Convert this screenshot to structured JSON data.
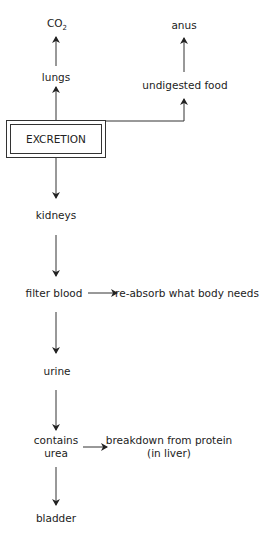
{
  "diagram": {
    "central_node": "EXCRETION",
    "nodes": {
      "co2": "CO",
      "co2_sub": "2",
      "lungs": "lungs",
      "anus": "anus",
      "undigested_food": "undigested food",
      "kidneys": "kidneys",
      "filter_blood": "filter blood",
      "reabsorb": "re-absorb what body needs",
      "urine": "urine",
      "contains_line1": "contains",
      "contains_line2": "urea",
      "breakdown_line1": "breakdown from protein",
      "breakdown_line2": "(in liver)",
      "bladder": "bladder"
    },
    "edges": [
      {
        "from": "EXCRETION",
        "to": "lungs"
      },
      {
        "from": "lungs",
        "to": "CO2"
      },
      {
        "from": "EXCRETION",
        "to": "undigested food"
      },
      {
        "from": "undigested food",
        "to": "anus"
      },
      {
        "from": "EXCRETION",
        "to": "kidneys"
      },
      {
        "from": "kidneys",
        "to": "filter blood"
      },
      {
        "from": "filter blood",
        "to": "re-absorb what body needs"
      },
      {
        "from": "filter blood",
        "to": "urine"
      },
      {
        "from": "urine",
        "to": "contains urea"
      },
      {
        "from": "contains urea",
        "to": "breakdown from protein (in liver)"
      },
      {
        "from": "contains urea",
        "to": "bladder"
      }
    ],
    "line_color": "#333333"
  }
}
